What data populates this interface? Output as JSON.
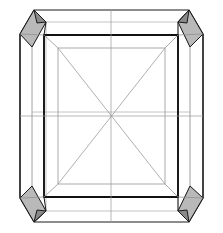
{
  "figure": {
    "canvas": {
      "width": 223,
      "height": 233,
      "background": "#ffffff"
    },
    "style": {
      "outline_color": "#1a1a1a",
      "front_edge_color": "#111111",
      "hidden_edge_color": "#b0b0b0",
      "inner_edge_color": "#8d8d8d",
      "diagonal_color": "#9a9a9a",
      "shaded_facet_fill": "#b9b9b9"
    },
    "geometry": {
      "outer_octagon": "20,34 34,10 189,10 203,34 203,198 189,222 34,222 20,198",
      "back_octagon": "32,47 46,22 178,22 190,47 190,186 178,211 46,211 32,186",
      "front_square": "44,35 178,35 178,197 44,197",
      "inner_square": "58,48 165,48 165,184 58,184",
      "center": {
        "x": 111,
        "y": 116
      }
    },
    "corner_facets": [
      {
        "name": "top-left-bevel",
        "shaded": true,
        "fill": "#b9b9b9",
        "points": "20,34 34,10 46,22 32,47"
      },
      {
        "name": "top-right-bevel",
        "shaded": true,
        "fill": "#b9b9b9",
        "points": "203,34 189,10 178,22 190,47"
      },
      {
        "name": "bottom-left-bevel",
        "shaded": true,
        "fill": "#b9b9b9",
        "points": "20,198 34,222 46,211 32,186"
      },
      {
        "name": "bottom-right-bevel",
        "shaded": true,
        "fill": "#b9b9b9",
        "points": "203,198 189,222 178,211 190,186"
      }
    ],
    "shaded_inner_facets": [
      {
        "name": "top-left-inner-facet",
        "points": "34,10 46,22 44,35"
      },
      {
        "name": "top-right-inner-facet",
        "points": "189,10 178,22 178,35"
      },
      {
        "name": "bottom-left-inner-facet",
        "points": "34,222 46,211 44,197"
      },
      {
        "name": "bottom-right-inner-facet",
        "points": "189,222 178,211 178,197"
      }
    ],
    "construction_lines": {
      "diagonals": [
        {
          "name": "diagonal-tl-br",
          "x1": 58,
          "y1": 48,
          "x2": 165,
          "y2": 184
        },
        {
          "name": "diagonal-tr-bl",
          "x1": 165,
          "y1": 48,
          "x2": 58,
          "y2": 184
        }
      ],
      "axes": [
        {
          "name": "axis-vertical",
          "x1": 111,
          "y1": 10,
          "x2": 111,
          "y2": 222
        },
        {
          "name": "axis-horizontal",
          "x1": 20,
          "y1": 116,
          "x2": 203,
          "y2": 116
        }
      ]
    }
  }
}
